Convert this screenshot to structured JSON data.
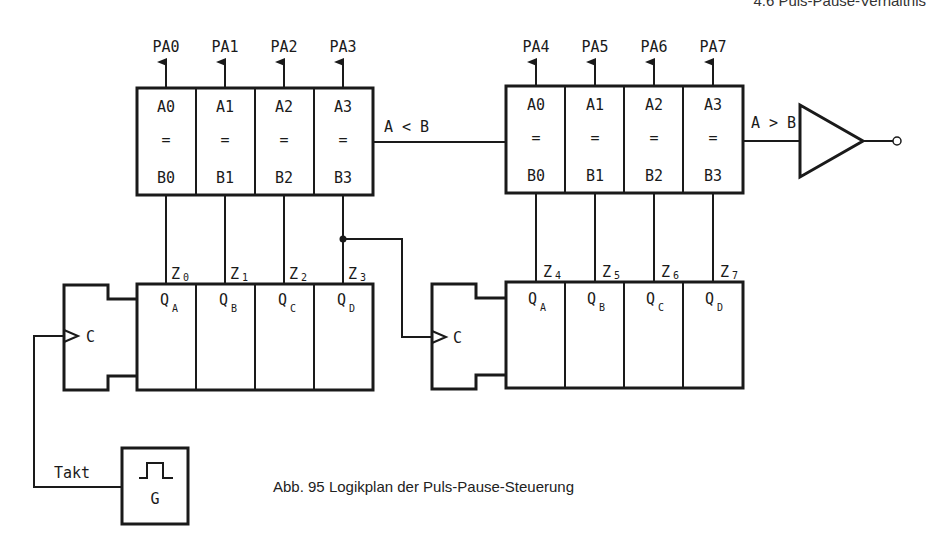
{
  "header": {
    "running_title": "4.6 Puls-Pause-Verhältnis"
  },
  "comparator_1": {
    "outputs": [
      "PA0",
      "PA1",
      "PA2",
      "PA3"
    ],
    "a_inputs": [
      "A0",
      "A1",
      "A2",
      "A3"
    ],
    "eq_symbol": "=",
    "b_inputs": [
      "B0",
      "B1",
      "B2",
      "B3"
    ],
    "result_label": "A < B"
  },
  "comparator_2": {
    "outputs": [
      "PA4",
      "PA5",
      "PA6",
      "PA7"
    ],
    "a_inputs": [
      "A0",
      "A1",
      "A2",
      "A3"
    ],
    "eq_symbol": "=",
    "b_inputs": [
      "B0",
      "B1",
      "B2",
      "B3"
    ],
    "result_label": "A > B"
  },
  "counter_1": {
    "clock_label": "C",
    "outputs": [
      {
        "q": "Q",
        "sub": "A",
        "z": "Z",
        "zsub": "0"
      },
      {
        "q": "Q",
        "sub": "B",
        "z": "Z",
        "zsub": "1"
      },
      {
        "q": "Q",
        "sub": "C",
        "z": "Z",
        "zsub": "2"
      },
      {
        "q": "Q",
        "sub": "D",
        "z": "Z",
        "zsub": "3"
      }
    ]
  },
  "counter_2": {
    "clock_label": "C",
    "outputs": [
      {
        "q": "Q",
        "sub": "A",
        "z": "Z",
        "zsub": "4"
      },
      {
        "q": "Q",
        "sub": "B",
        "z": "Z",
        "zsub": "5"
      },
      {
        "q": "Q",
        "sub": "C",
        "z": "Z",
        "zsub": "6"
      },
      {
        "q": "Q",
        "sub": "D",
        "z": "Z",
        "zsub": "7"
      }
    ]
  },
  "generator": {
    "label": "G",
    "clock_signal": "Takt"
  },
  "caption": "Abb. 95  Logikplan der Puls-Pause-Steuerung"
}
